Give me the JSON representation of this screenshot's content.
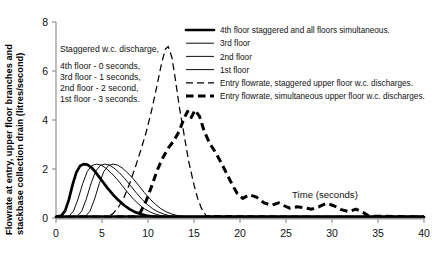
{
  "chart_data": {
    "type": "line",
    "title": "",
    "xlabel": "Time (seconds)",
    "ylabel": "Flowrate at entry, upper floor branches and stackbase collection drain (litres/second)",
    "ylabel_line1": "Flowrate at entry, upper floor branches and",
    "ylabel_line2": "stackbase collection drain (litres/second)",
    "xlim": [
      0,
      40
    ],
    "ylim": [
      0,
      8
    ],
    "xticks": [
      0,
      5,
      10,
      15,
      20,
      25,
      30,
      35,
      40
    ],
    "yticks": [
      0,
      2,
      4,
      6,
      8
    ],
    "grid": false,
    "legend_position": "top-right",
    "annotation": {
      "heading": "Staggered w.c. discharge,",
      "lines": [
        "4th  floor   - 0 seconds,",
        "3rd  floor   - 1 seconds,",
        "2nd floor   - 2 second,",
        "1st  floor   - 3 seconds."
      ]
    },
    "series": [
      {
        "name": "4th floor staggered and all floors simultaneous.",
        "style": "thick-solid",
        "color": "#000000",
        "x": [
          0.0,
          0.6,
          1.0,
          1.4,
          1.8,
          2.2,
          2.6,
          3.0,
          3.4,
          3.8,
          4.2,
          4.6,
          5.0,
          5.6,
          6.2,
          6.8,
          7.4,
          8.0,
          8.6,
          9.2,
          9.8,
          10.4,
          11.0,
          11.6,
          12.2,
          13.0,
          40.0
        ],
        "y": [
          0.05,
          0.1,
          0.3,
          0.75,
          1.35,
          1.85,
          2.12,
          2.2,
          2.18,
          2.08,
          1.92,
          1.72,
          1.52,
          1.22,
          0.95,
          0.72,
          0.52,
          0.36,
          0.24,
          0.16,
          0.1,
          0.07,
          0.05,
          0.04,
          0.04,
          0.04,
          0.04
        ]
      },
      {
        "name": "3rd floor",
        "style": "thin-solid",
        "color": "#000000",
        "x": [
          0.0,
          1.4,
          1.9,
          2.4,
          2.9,
          3.4,
          3.9,
          4.4,
          4.9,
          5.4,
          6.0,
          6.6,
          7.2,
          7.8,
          8.4,
          9.0,
          9.6,
          10.2,
          10.8,
          11.4,
          12.0,
          13.0,
          40.0
        ],
        "y": [
          0.04,
          0.07,
          0.28,
          0.78,
          1.4,
          1.9,
          2.14,
          2.2,
          2.16,
          2.04,
          1.84,
          1.6,
          1.32,
          1.04,
          0.78,
          0.56,
          0.38,
          0.25,
          0.16,
          0.1,
          0.06,
          0.04,
          0.04
        ]
      },
      {
        "name": "2nd floor",
        "style": "thin-solid",
        "color": "#000000",
        "x": [
          0.0,
          2.3,
          2.8,
          3.3,
          3.8,
          4.3,
          4.8,
          5.3,
          5.8,
          6.3,
          6.9,
          7.5,
          8.1,
          8.7,
          9.3,
          9.9,
          10.5,
          11.1,
          11.7,
          12.3,
          13.0,
          14.0,
          40.0
        ],
        "y": [
          0.04,
          0.07,
          0.28,
          0.78,
          1.4,
          1.9,
          2.14,
          2.2,
          2.16,
          2.04,
          1.84,
          1.6,
          1.32,
          1.04,
          0.78,
          0.56,
          0.38,
          0.25,
          0.16,
          0.1,
          0.06,
          0.04,
          0.04
        ]
      },
      {
        "name": "1st floor",
        "style": "thin-solid",
        "color": "#000000",
        "x": [
          0.0,
          3.2,
          3.7,
          4.2,
          4.7,
          5.2,
          5.7,
          6.2,
          6.7,
          7.2,
          7.8,
          8.4,
          9.0,
          9.6,
          10.2,
          10.8,
          11.4,
          12.0,
          12.6,
          13.2,
          14.0,
          15.0,
          40.0
        ],
        "y": [
          0.04,
          0.07,
          0.28,
          0.78,
          1.4,
          1.9,
          2.14,
          2.2,
          2.16,
          2.04,
          1.84,
          1.6,
          1.32,
          1.04,
          0.78,
          0.56,
          0.38,
          0.25,
          0.16,
          0.1,
          0.06,
          0.04,
          0.04
        ]
      },
      {
        "name": "Entry flowrate, staggered upper floor w.c. discharges.",
        "style": "thin-dashed",
        "color": "#000000",
        "x": [
          0.0,
          5.6,
          6.2,
          6.8,
          7.4,
          8.0,
          8.6,
          9.2,
          9.8,
          10.4,
          11.0,
          11.5,
          11.9,
          12.2,
          12.6,
          13.0,
          13.4,
          13.9,
          14.4,
          15.0,
          15.4,
          15.8,
          16.3,
          40.0
        ],
        "y": [
          0.03,
          0.05,
          0.18,
          0.45,
          0.85,
          1.4,
          2.05,
          2.75,
          3.5,
          4.4,
          5.45,
          6.35,
          6.9,
          7.0,
          6.55,
          5.6,
          4.55,
          3.45,
          2.35,
          1.35,
          0.8,
          0.4,
          0.1,
          0.04
        ]
      },
      {
        "name": "Entry flowrate, simultaneous upper floor w.c. discharges.",
        "style": "thick-dashed",
        "color": "#000000",
        "x": [
          0.0,
          8.6,
          9.2,
          9.8,
          10.4,
          11.0,
          11.6,
          12.2,
          12.8,
          13.4,
          13.9,
          14.3,
          14.7,
          15.1,
          15.6,
          16.1,
          16.7,
          17.3,
          17.9,
          18.5,
          19.1,
          19.7,
          20.3,
          21.0,
          21.8,
          22.6,
          23.4,
          24.2,
          24.8,
          25.4,
          26.2,
          27.0,
          27.8,
          28.6,
          29.4,
          30.2,
          31.0,
          31.8,
          32.6,
          33.4,
          34.0,
          40.0
        ],
        "y": [
          0.03,
          0.05,
          0.25,
          0.7,
          1.3,
          1.95,
          2.45,
          2.85,
          3.15,
          3.55,
          4.05,
          4.35,
          4.1,
          4.4,
          4.15,
          3.55,
          3.05,
          2.7,
          2.3,
          1.85,
          1.4,
          1.0,
          0.8,
          0.95,
          0.85,
          0.62,
          0.52,
          0.62,
          0.5,
          0.4,
          0.46,
          0.42,
          0.36,
          0.46,
          0.6,
          0.5,
          0.34,
          0.26,
          0.36,
          0.22,
          0.08,
          0.04
        ]
      }
    ],
    "legend": [
      {
        "label": "4th floor staggered and all floors simultaneous.",
        "style": "thick-solid"
      },
      {
        "label": "3rd floor",
        "style": "thin-solid"
      },
      {
        "label": "2nd floor",
        "style": "thin-solid"
      },
      {
        "label": "1st floor",
        "style": "thin-solid"
      },
      {
        "label": "Entry flowrate, staggered upper floor w.c. discharges.",
        "style": "thin-dashed"
      },
      {
        "label": "Entry flowrate, simultaneous upper floor w.c. discharges.",
        "style": "thick-dashed"
      }
    ]
  }
}
